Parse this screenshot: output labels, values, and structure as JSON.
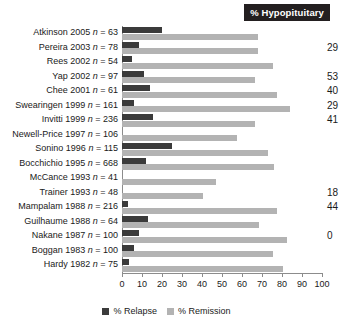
{
  "header": {
    "badge_label": "% Hypopituitary"
  },
  "legend": {
    "items": [
      {
        "key": "relapse",
        "label": "% Relapse",
        "color": "#3b3b3b"
      },
      {
        "key": "remission",
        "label": "% Remission",
        "color": "#b3b3b3"
      }
    ]
  },
  "axis": {
    "ticks": [
      "0",
      "10",
      "20",
      "30",
      "40",
      "50",
      "60",
      "70",
      "80",
      "90",
      "100"
    ]
  },
  "chart_data": {
    "type": "bar",
    "orientation": "horizontal",
    "title": "",
    "xlabel": "",
    "ylabel": "",
    "xlim": [
      0,
      100
    ],
    "grid": false,
    "legend_position": "bottom-center",
    "categories": [
      "Atkinson 2005 n = 63",
      "Pereira 2003 n = 78",
      "Rees 2002 n = 54",
      "Yap 2002 n = 97",
      "Chee 2001 n = 61",
      "Swearingen 1999 n = 161",
      "Invitti 1999 n = 236",
      "Newell-Price 1997 n = 106",
      "Sonino 1996 n = 115",
      "Bocchichio 1995 n = 668",
      "McCance 1993 n = 41",
      "Trainer 1993 n = 48",
      "Mampalam 1988 n = 216",
      "Guilhaume 1988 n = 64",
      "Nakane 1987 n = 100",
      "Boggan 1983 n = 100",
      "Hardy 1982 n = 75"
    ],
    "category_parts": [
      {
        "author": "Atkinson",
        "year": "2005",
        "n": "63"
      },
      {
        "author": "Pereira",
        "year": "2003",
        "n": "78"
      },
      {
        "author": "Rees",
        "year": "2002",
        "n": "54"
      },
      {
        "author": "Yap",
        "year": "2002",
        "n": "97"
      },
      {
        "author": "Chee",
        "year": "2001",
        "n": "61"
      },
      {
        "author": "Swearingen",
        "year": "1999",
        "n": "161"
      },
      {
        "author": "Invitti",
        "year": "1999",
        "n": "236"
      },
      {
        "author": "Newell-Price",
        "year": "1997",
        "n": "106"
      },
      {
        "author": "Sonino",
        "year": "1996",
        "n": "115"
      },
      {
        "author": "Bocchichio",
        "year": "1995",
        "n": "668"
      },
      {
        "author": "McCance",
        "year": "1993",
        "n": "41"
      },
      {
        "author": "Trainer",
        "year": "1993",
        "n": "48"
      },
      {
        "author": "Mampalam",
        "year": "1988",
        "n": "216"
      },
      {
        "author": "Guilhaume",
        "year": "1988",
        "n": "64"
      },
      {
        "author": "Nakane",
        "year": "1987",
        "n": "100"
      },
      {
        "author": "Boggan",
        "year": "1983",
        "n": "100"
      },
      {
        "author": "Hardy",
        "year": "1982",
        "n": "75"
      }
    ],
    "series": [
      {
        "name": "% Relapse",
        "color": "#3b3b3b",
        "values": [
          20,
          8.5,
          5,
          11,
          14,
          6,
          15.5,
          0,
          25,
          12,
          0,
          0,
          3,
          13,
          8.5,
          6,
          3.5
        ]
      },
      {
        "name": "% Remission",
        "color": "#b3b3b3",
        "values": [
          68,
          68,
          75.5,
          66.5,
          77.5,
          84,
          66.5,
          57.5,
          73,
          76,
          47,
          40.5,
          77.5,
          68.5,
          82.5,
          75.5,
          80.5
        ]
      }
    ],
    "hypopituitary": [
      "",
      "29",
      "",
      "53",
      "40",
      "29",
      "41",
      "",
      "",
      "",
      "",
      "18",
      "44",
      "",
      "0",
      "",
      ""
    ]
  }
}
